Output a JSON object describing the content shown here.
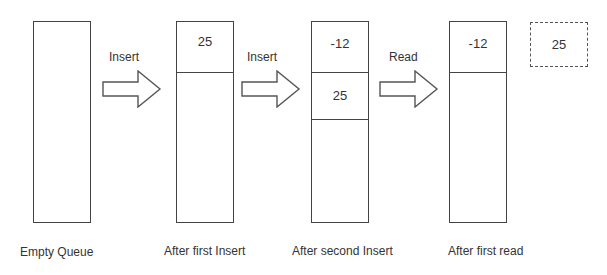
{
  "diagram": {
    "type": "queue-operations",
    "stages": [
      {
        "caption": "Empty Queue",
        "cells": []
      },
      {
        "caption": "After first Insert",
        "cells": [
          "25"
        ]
      },
      {
        "caption": "After second Insert",
        "cells": [
          "-12",
          "25"
        ]
      },
      {
        "caption": "After first read",
        "cells": [
          "-12"
        ]
      }
    ],
    "operations": [
      {
        "label": "Insert"
      },
      {
        "label": "Insert"
      },
      {
        "label": "Read"
      }
    ],
    "read_output": {
      "value": "25",
      "style": "dashed"
    }
  }
}
